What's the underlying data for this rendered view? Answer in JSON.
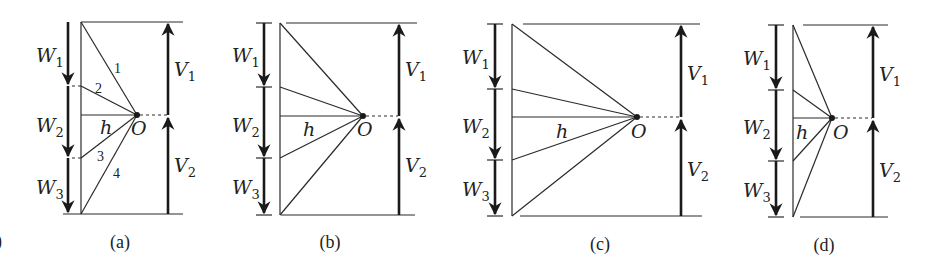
{
  "figure": {
    "stray_mark": ")",
    "panels": [
      {
        "id": "a",
        "caption": "(a)",
        "labels": {
          "W1": "W",
          "W1_sub": "1",
          "W2": "W",
          "W2_sub": "2",
          "W3": "W",
          "W3_sub": "3",
          "V1": "V",
          "V1_sub": "1",
          "V2": "V",
          "V2_sub": "2",
          "h": "h",
          "O": "O"
        },
        "line_numbers": [
          "1",
          "2",
          "3",
          "4"
        ]
      },
      {
        "id": "b",
        "caption": "(b)",
        "labels": {
          "W1": "W",
          "W1_sub": "1",
          "W2": "W",
          "W2_sub": "2",
          "W3": "W",
          "W3_sub": "3",
          "V1": "V",
          "V1_sub": "1",
          "V2": "V",
          "V2_sub": "2",
          "h": "h",
          "O": "O"
        }
      },
      {
        "id": "c",
        "caption": "(c)",
        "labels": {
          "W1": "W",
          "W1_sub": "1",
          "W2": "W",
          "W2_sub": "2",
          "W3": "W",
          "W3_sub": "3",
          "V1": "V",
          "V1_sub": "1",
          "V2": "V",
          "V2_sub": "2",
          "h": "h",
          "O": "O"
        }
      },
      {
        "id": "d",
        "caption": "(d)",
        "labels": {
          "W1": "W",
          "W1_sub": "1",
          "W2": "W",
          "W2_sub": "2",
          "W3": "W",
          "W3_sub": "3",
          "V1": "V",
          "V1_sub": "1",
          "V2": "V",
          "V2_sub": "2",
          "h": "h",
          "O": "O"
        }
      }
    ]
  }
}
